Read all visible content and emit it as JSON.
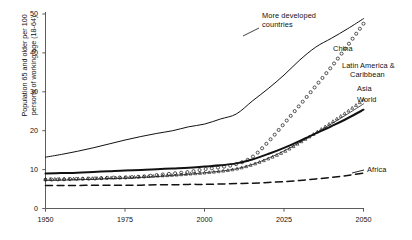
{
  "chart_data": {
    "type": "line",
    "title": "",
    "xlabel": "",
    "ylabel": "Population 65 and older per 100 persons of working age (18-64)",
    "ylabel_line1": "Population 65 and older per 100",
    "ylabel_line2": "persons of working age (18-64)",
    "xlim": [
      1950,
      2050
    ],
    "ylim": [
      0,
      50
    ],
    "xticks": [
      "1950",
      "1975",
      "2000",
      "2025",
      "2050"
    ],
    "xtick_values": [
      1950,
      1975,
      2000,
      2025,
      2050
    ],
    "yticks": [
      "0",
      "10",
      "20",
      "30",
      "40",
      "50"
    ],
    "ytick_values": [
      0,
      10,
      20,
      30,
      40,
      50
    ],
    "grid": false,
    "legend_position": "inline-annotations",
    "x": [
      1950,
      1955,
      1960,
      1965,
      1970,
      1975,
      1980,
      1985,
      1990,
      1995,
      2000,
      2005,
      2010,
      2015,
      2020,
      2025,
      2030,
      2035,
      2040,
      2045,
      2050
    ],
    "series": [
      {
        "name": "More developed countries",
        "style": "solid-thin",
        "values": [
          13.2,
          13.9,
          14.7,
          15.6,
          16.6,
          17.6,
          18.5,
          19.3,
          20.0,
          21.0,
          21.7,
          23.0,
          24.3,
          27.6,
          30.8,
          34.3,
          38.2,
          41.5,
          43.8,
          46.2,
          48.8
        ]
      },
      {
        "name": "China",
        "style": "open-circles",
        "values": [
          7.4,
          7.5,
          7.6,
          7.7,
          7.9,
          8.0,
          8.2,
          8.6,
          9.0,
          9.4,
          10.1,
          10.6,
          11.4,
          13.2,
          17.1,
          21.8,
          26.6,
          31.5,
          36.5,
          41.9,
          47.5
        ]
      },
      {
        "name": "Latin America & Caribbean",
        "style": "dotted-triangles",
        "values": [
          7.6,
          7.6,
          7.7,
          7.8,
          7.9,
          8.0,
          8.2,
          8.4,
          8.6,
          8.9,
          9.2,
          9.6,
          10.2,
          11.3,
          12.8,
          14.6,
          17.0,
          19.5,
          22.2,
          25.0,
          28.0
        ]
      },
      {
        "name": "Asia",
        "style": "solid-hairline",
        "values": [
          7.2,
          7.3,
          7.4,
          7.5,
          7.7,
          7.8,
          8.0,
          8.2,
          8.5,
          8.8,
          9.2,
          9.6,
          10.2,
          11.3,
          12.9,
          14.8,
          17.0,
          19.4,
          21.8,
          24.3,
          26.9
        ]
      },
      {
        "name": "World",
        "style": "solid-thick",
        "values": [
          9.0,
          9.1,
          9.2,
          9.4,
          9.6,
          9.8,
          9.9,
          10.1,
          10.3,
          10.5,
          10.8,
          11.1,
          11.6,
          12.6,
          14.0,
          15.6,
          17.4,
          19.3,
          21.2,
          23.2,
          25.4
        ]
      },
      {
        "name": "Africa",
        "style": "dashed",
        "values": [
          5.9,
          5.9,
          5.9,
          6.0,
          6.0,
          6.0,
          6.0,
          6.1,
          6.1,
          6.2,
          6.2,
          6.3,
          6.4,
          6.5,
          6.7,
          6.9,
          7.2,
          7.6,
          8.0,
          8.5,
          9.1
        ]
      }
    ],
    "annotations": [
      {
        "name": "more-developed-countries",
        "text_line1": "More developed",
        "text_line2": "countries",
        "x_px": 262,
        "y_px": 14
      },
      {
        "name": "china",
        "text_line1": "China",
        "text_line2": "",
        "x_px": 333,
        "y_px": 46
      },
      {
        "name": "latin-america-caribbean",
        "text_line1": "Latin America &",
        "text_line2": "Caribbean",
        "x_px": 345,
        "y_px": 64
      },
      {
        "name": "asia",
        "text_line1": "Asia",
        "text_line2": "",
        "x_px": 356,
        "y_px": 88
      },
      {
        "name": "world",
        "text_line1": "World",
        "text_line2": "",
        "x_px": 356,
        "y_px": 99
      },
      {
        "name": "africa",
        "text_line1": "Africa",
        "text_line2": "",
        "x_px": 366,
        "y_px": 166
      }
    ]
  },
  "axes": {
    "x_tick_labels": [
      "1950",
      "1975",
      "2000",
      "2025",
      "2050"
    ],
    "y_tick_labels": [
      "0",
      "10",
      "20",
      "30",
      "40",
      "50"
    ]
  },
  "caption": {
    "text": ""
  },
  "colors": {
    "background": "#ffffff",
    "ink": "#111111",
    "axis": "#4a4a4a"
  }
}
